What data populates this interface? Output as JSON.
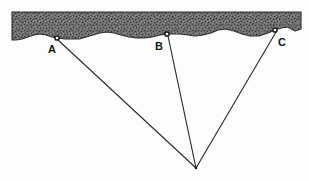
{
  "diagram": {
    "canvas": {
      "width": 309,
      "height": 181
    },
    "colors": {
      "background": "#fdfdfd",
      "ground_fill": "#6e6e6e",
      "ground_stipple_dark": "#3a3a3a",
      "ground_stipple_light": "#9a9a9a",
      "line": "#2b2b2b",
      "label": "#151515",
      "marker_fill": "#1a1a1a"
    },
    "ground_layer": {
      "name": "ground-surface-hatched-band",
      "top_y": 12,
      "left_x": 12,
      "right_x": 301,
      "surface_path": "M12,12 L301,12 L301,29 L295,31 L288,27 L281,28 L275,30 L268,33 L259,36 L250,36 L242,34 L234,31 L226,29 L218,30 L211,33 L203,35 L195,36 L188,35 L180,34 L173,34 L167,34 L160,35 L152,37 L145,38 L137,38 L129,37 L121,35 L114,33 L107,32 L100,33 L93,35 L86,37 L79,39 L72,39 L65,39 L58,38 L52,37 L46,35 L40,34 L34,35 L28,37 L22,39 L16,40 L12,40 Z"
    },
    "stations": [
      {
        "id": "A",
        "label": "A",
        "x": 57,
        "y": 38,
        "label_x": 48,
        "label_y": 53
      },
      {
        "id": "B",
        "label": "B",
        "x": 167,
        "y": 34,
        "label_x": 155,
        "label_y": 50
      },
      {
        "id": "C",
        "label": "C",
        "x": 275,
        "y": 30,
        "label_x": 278,
        "label_y": 46
      }
    ],
    "hypocenter": {
      "id": "focus",
      "x": 196,
      "y": 168,
      "label": ""
    },
    "rays": [
      {
        "name": "ray-A-to-focus",
        "from": "A",
        "to": "focus",
        "x1": 58,
        "y1": 40,
        "x2": 196,
        "y2": 168
      },
      {
        "name": "ray-B-to-focus",
        "from": "B",
        "to": "focus",
        "x1": 168,
        "y1": 36,
        "x2": 196,
        "y2": 168
      },
      {
        "name": "ray-C-to-focus",
        "from": "C",
        "to": "focus",
        "x1": 276,
        "y1": 32,
        "x2": 196,
        "y2": 168
      }
    ]
  }
}
